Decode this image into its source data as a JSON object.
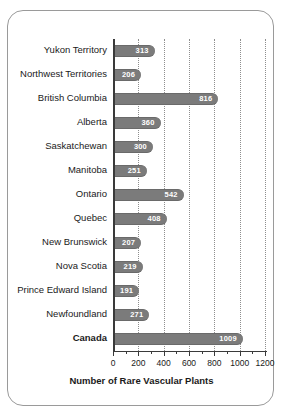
{
  "chart_data": {
    "type": "bar",
    "orientation": "horizontal",
    "title": "",
    "xlabel": "Number of Rare Vascular Plants",
    "ylabel": "",
    "xlim": [
      0,
      1200
    ],
    "xticks": [
      0,
      200,
      400,
      600,
      800,
      1000,
      1200
    ],
    "xtick_labels": [
      "0",
      "200",
      "400",
      "600",
      "800",
      "1000",
      "1200"
    ],
    "grid": true,
    "grid_axis": "x",
    "grid_style": "dotted",
    "legend": false,
    "bar_color": "#7b7b7b",
    "label_color": "#ffffff",
    "categories": [
      "Yukon Territory",
      "Northwest Territories",
      "British Columbia",
      "Alberta",
      "Saskatchewan",
      "Manitoba",
      "Ontario",
      "Quebec",
      "New Brunswick",
      "Nova Scotia",
      "Prince Edward Island",
      "Newfoundland",
      "Canada"
    ],
    "values": [
      313,
      206,
      816,
      360,
      300,
      251,
      542,
      408,
      207,
      219,
      191,
      271,
      1009
    ],
    "emphasis": [
      "Canada"
    ],
    "bars": [
      {
        "category": "Yukon Territory",
        "value": 313,
        "label": "313",
        "bold_category": false
      },
      {
        "category": "Northwest Territories",
        "value": 206,
        "label": "206",
        "bold_category": false
      },
      {
        "category": "British Columbia",
        "value": 816,
        "label": "816",
        "bold_category": false
      },
      {
        "category": "Alberta",
        "value": 360,
        "label": "360",
        "bold_category": false
      },
      {
        "category": "Saskatchewan",
        "value": 300,
        "label": "300",
        "bold_category": false
      },
      {
        "category": "Manitoba",
        "value": 251,
        "label": "251",
        "bold_category": false
      },
      {
        "category": "Ontario",
        "value": 542,
        "label": "542",
        "bold_category": false
      },
      {
        "category": "Quebec",
        "value": 408,
        "label": "408",
        "bold_category": false
      },
      {
        "category": "New Brunswick",
        "value": 207,
        "label": "207",
        "bold_category": false
      },
      {
        "category": "Nova Scotia",
        "value": 219,
        "label": "219",
        "bold_category": false
      },
      {
        "category": "Prince Edward Island",
        "value": 191,
        "label": "191",
        "bold_category": false
      },
      {
        "category": "Newfoundland",
        "value": 271,
        "label": "271",
        "bold_category": false
      },
      {
        "category": "Canada",
        "value": 1009,
        "label": "1009",
        "bold_category": true
      }
    ]
  }
}
